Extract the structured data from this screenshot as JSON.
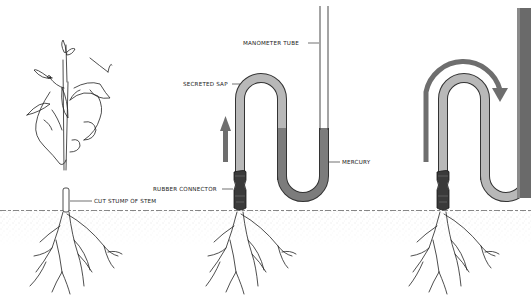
{
  "diagram": {
    "panels": [
      {
        "id": "panel-1",
        "description": "Hand cutting the stem of a plant; cut stump left in soil"
      },
      {
        "id": "panel-2",
        "description": "Manometer attached to stump; sap pushes mercury up"
      },
      {
        "id": "panel-3",
        "description": "Sap flows over the bend of the tube"
      }
    ],
    "labels": {
      "cut_stump": "CUT STUMP OF STEM",
      "rubber_connector": "RUBBER CONNECTOR",
      "secreted_sap": "SECRETED SAP",
      "manometer_tube": "MANOMETER TUBE",
      "mercury": "MERCURY"
    },
    "colors": {
      "sap": "#b8b8b8",
      "mercury": "#7c7c7c",
      "arrow": "#6e6e6e",
      "outline": "#333333",
      "connector": "#3a3a3a",
      "soil": "#999999"
    }
  }
}
